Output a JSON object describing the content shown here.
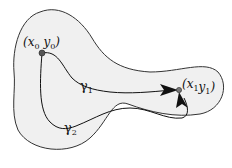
{
  "diagram": {
    "type": "path-independence-region",
    "colors": {
      "region_fill": "#f0f0f0",
      "region_stroke": "#333333",
      "curve_stroke": "#111111",
      "point_fill": "#555555"
    },
    "points": [
      {
        "id": "start",
        "var_x": "x",
        "var_y": "y",
        "subscript": "0",
        "label": "(x0 y0)"
      },
      {
        "id": "end",
        "var_x": "x",
        "var_y": "y",
        "subscript": "1",
        "label": "(x1 y1)"
      }
    ],
    "curves": [
      {
        "id": "gamma1",
        "symbol": "γ",
        "subscript": "1"
      },
      {
        "id": "gamma2",
        "symbol": "γ",
        "subscript": "2"
      }
    ]
  }
}
